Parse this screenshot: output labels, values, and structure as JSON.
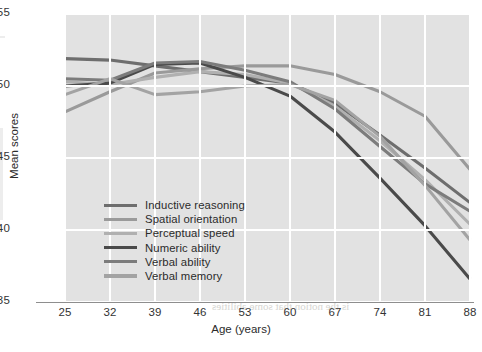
{
  "chart_data": {
    "type": "line",
    "title": "",
    "xlabel": "Age (years)",
    "ylabel": "Mean scores",
    "x": [
      25,
      32,
      39,
      46,
      53,
      60,
      67,
      74,
      81,
      88
    ],
    "xtick_labels": [
      "25",
      "32",
      "39",
      "46",
      "53",
      "60",
      "67",
      "74",
      "81",
      "88"
    ],
    "ytick_labels": [
      "35",
      "40",
      "45",
      "50",
      "55"
    ],
    "yticks": [
      35,
      40,
      45,
      50,
      55
    ],
    "xlim": [
      25,
      88
    ],
    "ylim": [
      35,
      55
    ],
    "grid": true,
    "legend_position": "inside lower-left",
    "plot_background": "#e2e2e2",
    "gridline_color": "#ffffff",
    "series": [
      {
        "name": "Inductive reasoning",
        "color": "#6e6e6e",
        "values": [
          51.9,
          51.8,
          51.4,
          51.0,
          50.6,
          50.2,
          48.8,
          46.6,
          44.3,
          41.9
        ]
      },
      {
        "name": "Spatial orientation",
        "color": "#9a9a9a",
        "values": [
          48.2,
          49.6,
          50.9,
          51.2,
          51.4,
          51.4,
          50.8,
          49.6,
          47.9,
          44.2
        ]
      },
      {
        "name": "Perceptual speed",
        "color": "#b0b0b0",
        "values": [
          50.3,
          50.1,
          50.6,
          51.0,
          50.8,
          50.2,
          48.6,
          46.2,
          43.5,
          40.4
        ]
      },
      {
        "name": "Numeric ability",
        "color": "#4a4a4a",
        "values": [
          50.0,
          50.2,
          51.5,
          51.6,
          50.6,
          49.3,
          46.8,
          43.6,
          40.3,
          36.6
        ]
      },
      {
        "name": "Verbal ability",
        "color": "#7c7c7c",
        "values": [
          50.5,
          50.4,
          51.6,
          51.7,
          51.1,
          50.3,
          48.4,
          45.8,
          43.2,
          41.3
        ]
      },
      {
        "name": "Verbal memory",
        "color": "#a3a3a3",
        "values": [
          49.4,
          50.5,
          49.4,
          49.6,
          50.0,
          50.1,
          49.0,
          46.5,
          43.1,
          39.3
        ]
      }
    ]
  },
  "axes": {
    "y_title": "Mean scores",
    "x_title": "Age (years)"
  },
  "legend": {
    "items": [
      {
        "label": "Inductive reasoning",
        "color": "#6e6e6e"
      },
      {
        "label": "Spatial orientation",
        "color": "#9a9a9a"
      },
      {
        "label": "Perceptual speed",
        "color": "#b0b0b0"
      },
      {
        "label": "Numeric ability",
        "color": "#4a4a4a"
      },
      {
        "label": "Verbal ability",
        "color": "#7c7c7c"
      },
      {
        "label": "Verbal memory",
        "color": "#a3a3a3"
      }
    ]
  },
  "background_text": [
    {
      "text": "fluid and crystallized intelligence",
      "x": 196,
      "y": 284,
      "size": 13
    },
    {
      "text": "is the notion that some abilities",
      "x": 212,
      "y": 300,
      "size": 11
    },
    {
      "text": "decline more rapidly than others",
      "x": 206,
      "y": 138,
      "size": 10
    },
    {
      "text": "Longitudinal studies of adult",
      "x": 224,
      "y": 158,
      "size": 10
    },
    {
      "text": "cognition show distinct",
      "x": 232,
      "y": 176,
      "size": 10
    },
    {
      "text": "trajectories across",
      "x": 248,
      "y": 194,
      "size": 10
    },
    {
      "text": "the lifespan",
      "x": 266,
      "y": 212,
      "size": 10
    },
    {
      "text": "Decline in later life",
      "x": 258,
      "y": 20,
      "size": 10
    },
    {
      "text": "verbal skills are preserved",
      "x": 228,
      "y": 38,
      "size": 10
    }
  ]
}
